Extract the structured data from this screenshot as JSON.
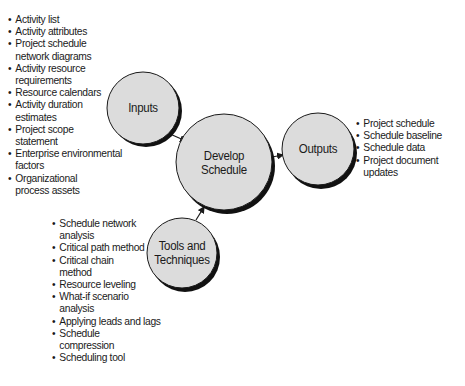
{
  "diagram": {
    "colors": {
      "circle_fill": "#dcdcdc",
      "circle_stroke": "#1a1a1a",
      "shadow": "#111111",
      "text": "#1a1a1a",
      "background": "#ffffff"
    },
    "nodes": {
      "inputs": {
        "label": "Inputs"
      },
      "process": {
        "label_line1": "Develop",
        "label_line2": "Schedule"
      },
      "outputs": {
        "label": "Outputs"
      },
      "tools": {
        "label_line1": "Tools and",
        "label_line2": "Techniques"
      }
    },
    "edges": [
      {
        "from": "Inputs",
        "to": "Develop Schedule"
      },
      {
        "from": "Tools and Techniques",
        "to": "Develop Schedule"
      },
      {
        "from": "Develop Schedule",
        "to": "Outputs"
      }
    ],
    "inputs_list": [
      "Activity list",
      "Activity attributes",
      "Project schedule network diagrams",
      "Activity resource requirements",
      "Resource calendars",
      "Activity duration estimates",
      "Project scope statement",
      "Enterprise environmental factors",
      "Organizational process assets"
    ],
    "inputs_list_lines": [
      [
        "Activity list"
      ],
      [
        "Activity attributes"
      ],
      [
        "Project schedule",
        "network diagrams"
      ],
      [
        "Activity resource",
        "requirements"
      ],
      [
        "Resource calendars"
      ],
      [
        "Activity duration",
        "estimates"
      ],
      [
        "Project scope",
        "statement"
      ],
      [
        "Enterprise environmental",
        "factors"
      ],
      [
        "Organizational",
        "process assets"
      ]
    ],
    "outputs_list": [
      "Project schedule",
      "Schedule baseline",
      "Schedule data",
      "Project document updates"
    ],
    "outputs_list_lines": [
      [
        "Project schedule"
      ],
      [
        "Schedule baseline"
      ],
      [
        "Schedule data"
      ],
      [
        "Project document",
        "updates"
      ]
    ],
    "tools_list": [
      "Schedule network analysis",
      "Critical path method",
      "Critical chain method",
      "Resource leveling",
      "What-if scenario analysis",
      "Applying leads and lags",
      "Schedule compression",
      "Scheduling tool"
    ],
    "tools_list_lines": [
      [
        "Schedule network",
        "analysis"
      ],
      [
        "Critical path method"
      ],
      [
        "Critical chain",
        "method"
      ],
      [
        "Resource leveling"
      ],
      [
        "What-if scenario",
        "analysis"
      ],
      [
        "Applying leads and lags"
      ],
      [
        "Schedule",
        "compression"
      ],
      [
        "Scheduling tool"
      ]
    ]
  }
}
